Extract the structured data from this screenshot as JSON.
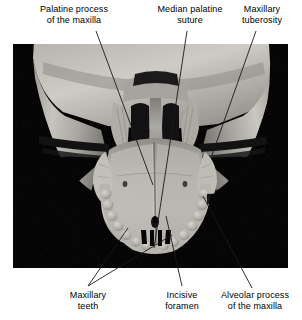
{
  "figure": {
    "type": "anatomy-photograph",
    "view": "inferior",
    "background_color": "#000000",
    "page_color": "#ffffff",
    "text_color": "#000000",
    "leader_color": "#1a1a1a"
  },
  "labels": {
    "palatine_process": {
      "line1": "Palatine process",
      "line2": "of the maxilla"
    },
    "median_palatine_suture": {
      "line1": "Median palatine",
      "line2": "suture"
    },
    "maxillary_tuberosity": {
      "line1": "Maxillary",
      "line2": "tuberosity"
    },
    "maxillary_teeth": {
      "line1": "Maxillary",
      "line2": "teeth"
    },
    "incisive_foramen": {
      "line1": "Incisive",
      "line2": "foramen"
    },
    "alveolar_process": {
      "line1": "Alveolar process",
      "line2": "of the maxilla"
    }
  }
}
